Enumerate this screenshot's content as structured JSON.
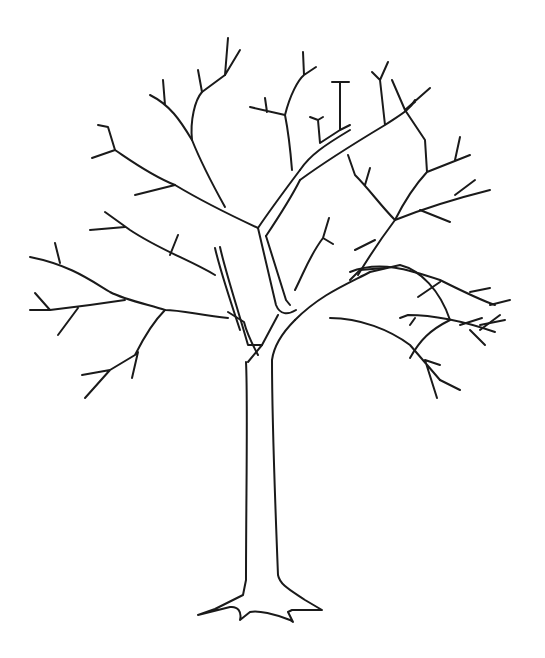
{
  "image": {
    "description": "Black line drawing of a bare deciduous tree with no leaves on a white background",
    "background_color": "#ffffff",
    "stroke_color": "#1a1a1a",
    "subject": "bare tree outline",
    "parts": [
      "trunk",
      "root flare",
      "main branches",
      "twigs"
    ]
  }
}
